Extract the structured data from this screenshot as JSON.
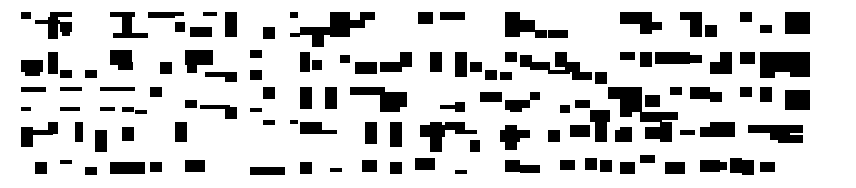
{
  "image": {
    "description": "abstract black-and-white maze block pattern",
    "background": "#ffffff",
    "foreground": "#000000",
    "bounds": {
      "x": 20,
      "y": 10,
      "w": 790,
      "h": 165
    }
  },
  "blocks": [
    [
      21,
      12,
      10,
      7
    ],
    [
      50,
      12,
      22,
      5
    ],
    [
      48,
      17,
      10,
      22
    ],
    [
      35,
      20,
      25,
      4
    ],
    [
      60,
      22,
      12,
      10
    ],
    [
      62,
      32,
      8,
      4
    ],
    [
      110,
      12,
      25,
      5
    ],
    [
      122,
      12,
      10,
      25
    ],
    [
      113,
      33,
      35,
      5
    ],
    [
      148,
      12,
      27,
      6
    ],
    [
      172,
      12,
      12,
      4
    ],
    [
      203,
      12,
      14,
      4
    ],
    [
      225,
      12,
      12,
      25
    ],
    [
      175,
      22,
      10,
      10
    ],
    [
      190,
      27,
      22,
      10
    ],
    [
      263,
      27,
      12,
      12
    ],
    [
      290,
      12,
      8,
      6
    ],
    [
      290,
      33,
      10,
      4
    ],
    [
      21,
      60,
      22,
      12
    ],
    [
      25,
      72,
      15,
      4
    ],
    [
      48,
      52,
      10,
      22
    ],
    [
      60,
      70,
      12,
      8
    ],
    [
      85,
      70,
      12,
      8
    ],
    [
      110,
      50,
      22,
      15
    ],
    [
      118,
      62,
      15,
      8
    ],
    [
      160,
      62,
      12,
      12
    ],
    [
      185,
      50,
      28,
      15
    ],
    [
      187,
      65,
      10,
      8
    ],
    [
      205,
      72,
      22,
      5
    ],
    [
      225,
      72,
      12,
      10
    ],
    [
      250,
      50,
      12,
      8
    ],
    [
      250,
      70,
      12,
      10
    ],
    [
      263,
      87,
      12,
      12
    ],
    [
      21,
      87,
      25,
      5
    ],
    [
      60,
      87,
      22,
      4
    ],
    [
      100,
      87,
      35,
      4
    ],
    [
      150,
      87,
      12,
      10
    ],
    [
      185,
      100,
      12,
      8
    ],
    [
      200,
      105,
      30,
      4
    ],
    [
      225,
      107,
      12,
      12
    ],
    [
      250,
      108,
      12,
      4
    ],
    [
      263,
      120,
      12,
      5
    ],
    [
      290,
      120,
      8,
      4
    ],
    [
      21,
      107,
      10,
      4
    ],
    [
      60,
      107,
      20,
      4
    ],
    [
      100,
      107,
      15,
      4
    ],
    [
      122,
      107,
      12,
      5
    ],
    [
      135,
      110,
      12,
      4
    ],
    [
      21,
      127,
      12,
      20
    ],
    [
      33,
      130,
      20,
      5
    ],
    [
      48,
      122,
      10,
      12
    ],
    [
      75,
      122,
      8,
      20
    ],
    [
      95,
      130,
      12,
      22
    ],
    [
      122,
      127,
      12,
      14
    ],
    [
      175,
      122,
      12,
      20
    ],
    [
      35,
      162,
      12,
      12
    ],
    [
      60,
      160,
      12,
      4
    ],
    [
      85,
      167,
      12,
      8
    ],
    [
      110,
      162,
      35,
      12
    ],
    [
      150,
      162,
      12,
      10
    ],
    [
      185,
      160,
      20,
      12
    ],
    [
      250,
      167,
      35,
      8
    ],
    [
      300,
      27,
      35,
      8
    ],
    [
      312,
      35,
      12,
      12
    ],
    [
      330,
      12,
      20,
      25
    ],
    [
      350,
      20,
      15,
      8
    ],
    [
      360,
      12,
      15,
      8
    ],
    [
      418,
      12,
      15,
      12
    ],
    [
      440,
      12,
      25,
      8
    ],
    [
      300,
      52,
      10,
      20
    ],
    [
      312,
      60,
      10,
      10
    ],
    [
      340,
      55,
      10,
      8
    ],
    [
      355,
      62,
      22,
      12
    ],
    [
      380,
      62,
      22,
      10
    ],
    [
      400,
      52,
      12,
      15
    ],
    [
      430,
      52,
      12,
      20
    ],
    [
      455,
      52,
      12,
      25
    ],
    [
      470,
      62,
      12,
      10
    ],
    [
      485,
      70,
      12,
      10
    ],
    [
      500,
      72,
      12,
      8
    ],
    [
      300,
      87,
      12,
      22
    ],
    [
      325,
      87,
      12,
      22
    ],
    [
      350,
      87,
      35,
      8
    ],
    [
      380,
      92,
      20,
      20
    ],
    [
      395,
      92,
      12,
      15
    ],
    [
      440,
      105,
      18,
      4
    ],
    [
      455,
      102,
      10,
      10
    ],
    [
      480,
      92,
      22,
      10
    ],
    [
      510,
      100,
      12,
      12
    ],
    [
      530,
      92,
      10,
      8
    ],
    [
      300,
      122,
      22,
      12
    ],
    [
      312,
      130,
      25,
      4
    ],
    [
      365,
      122,
      12,
      22
    ],
    [
      390,
      122,
      12,
      25
    ],
    [
      420,
      125,
      25,
      12
    ],
    [
      430,
      122,
      12,
      30
    ],
    [
      445,
      122,
      20,
      8
    ],
    [
      455,
      130,
      22,
      4
    ],
    [
      470,
      140,
      10,
      12
    ],
    [
      500,
      130,
      20,
      12
    ],
    [
      300,
      162,
      12,
      12
    ],
    [
      330,
      168,
      12,
      4
    ],
    [
      362,
      160,
      15,
      12
    ],
    [
      390,
      162,
      12,
      12
    ],
    [
      415,
      158,
      20,
      12
    ],
    [
      455,
      170,
      12,
      4
    ],
    [
      505,
      12,
      15,
      25
    ],
    [
      520,
      20,
      15,
      12
    ],
    [
      535,
      30,
      12,
      8
    ],
    [
      548,
      30,
      20,
      8
    ],
    [
      505,
      52,
      12,
      10
    ],
    [
      520,
      55,
      12,
      12
    ],
    [
      530,
      62,
      20,
      8
    ],
    [
      548,
      70,
      22,
      4
    ],
    [
      555,
      52,
      12,
      15
    ],
    [
      565,
      62,
      15,
      10
    ],
    [
      572,
      72,
      20,
      8
    ],
    [
      595,
      72,
      12,
      12
    ],
    [
      608,
      87,
      12,
      12
    ],
    [
      620,
      92,
      10,
      20
    ],
    [
      505,
      100,
      12,
      10
    ],
    [
      520,
      100,
      10,
      8
    ],
    [
      560,
      105,
      10,
      8
    ],
    [
      575,
      100,
      15,
      8
    ],
    [
      590,
      110,
      20,
      12
    ],
    [
      505,
      125,
      12,
      25
    ],
    [
      520,
      130,
      10,
      8
    ],
    [
      548,
      130,
      12,
      12
    ],
    [
      570,
      125,
      20,
      12
    ],
    [
      595,
      120,
      12,
      22
    ],
    [
      615,
      130,
      15,
      12
    ],
    [
      505,
      160,
      15,
      12
    ],
    [
      520,
      165,
      20,
      8
    ],
    [
      560,
      160,
      15,
      10
    ],
    [
      585,
      158,
      12,
      12
    ],
    [
      600,
      160,
      12,
      12
    ],
    [
      620,
      12,
      30,
      12
    ],
    [
      640,
      12,
      12,
      22
    ],
    [
      650,
      22,
      12,
      8
    ],
    [
      680,
      12,
      18,
      8
    ],
    [
      690,
      12,
      12,
      25
    ],
    [
      705,
      25,
      12,
      12
    ],
    [
      620,
      52,
      15,
      8
    ],
    [
      640,
      52,
      12,
      15
    ],
    [
      655,
      52,
      35,
      12
    ],
    [
      690,
      55,
      12,
      8
    ],
    [
      710,
      62,
      20,
      12
    ],
    [
      720,
      52,
      12,
      22
    ],
    [
      620,
      87,
      22,
      25
    ],
    [
      645,
      95,
      15,
      12
    ],
    [
      670,
      87,
      12,
      8
    ],
    [
      690,
      87,
      20,
      12
    ],
    [
      710,
      92,
      12,
      10
    ],
    [
      620,
      112,
      12,
      5
    ],
    [
      640,
      112,
      22,
      10
    ],
    [
      660,
      112,
      18,
      8
    ],
    [
      620,
      127,
      12,
      15
    ],
    [
      645,
      127,
      15,
      12
    ],
    [
      660,
      122,
      12,
      20
    ],
    [
      680,
      130,
      15,
      5
    ],
    [
      700,
      127,
      12,
      10
    ],
    [
      710,
      122,
      25,
      15
    ],
    [
      620,
      162,
      15,
      12
    ],
    [
      640,
      155,
      15,
      8
    ],
    [
      665,
      162,
      20,
      12
    ],
    [
      700,
      160,
      20,
      12
    ],
    [
      715,
      162,
      12,
      8
    ],
    [
      730,
      158,
      12,
      15
    ],
    [
      740,
      12,
      12,
      10
    ],
    [
      760,
      25,
      12,
      8
    ],
    [
      785,
      12,
      25,
      22
    ],
    [
      740,
      52,
      15,
      12
    ],
    [
      760,
      52,
      30,
      20
    ],
    [
      790,
      52,
      20,
      25
    ],
    [
      760,
      70,
      15,
      8
    ],
    [
      740,
      87,
      12,
      10
    ],
    [
      760,
      87,
      12,
      15
    ],
    [
      785,
      90,
      25,
      20
    ],
    [
      748,
      125,
      55,
      8
    ],
    [
      770,
      128,
      20,
      12
    ],
    [
      778,
      135,
      25,
      8
    ],
    [
      742,
      160,
      12,
      15
    ],
    [
      760,
      162,
      15,
      10
    ]
  ]
}
